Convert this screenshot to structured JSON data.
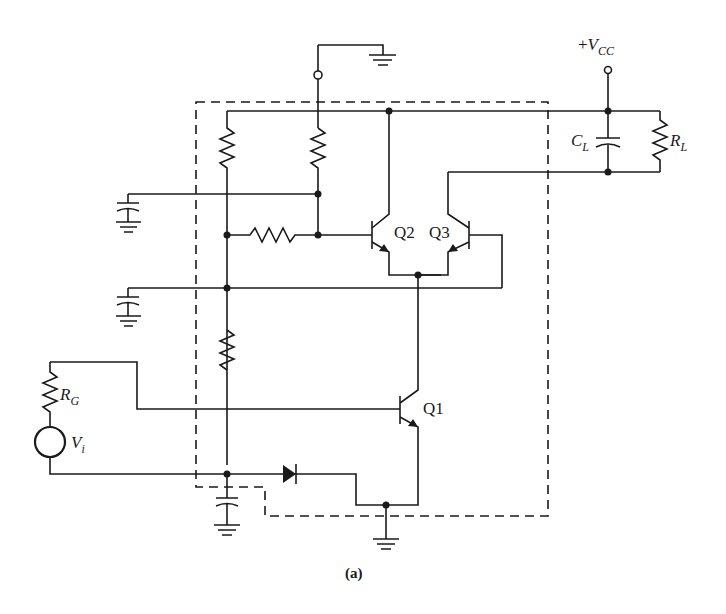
{
  "figure": {
    "caption": "(a)"
  },
  "labels": {
    "vcc_plus": "+",
    "vcc_main": "V",
    "vcc_sub": "CC",
    "cl_main": "C",
    "cl_sub": "L",
    "rl_main": "R",
    "rl_sub": "L",
    "rg_main": "R",
    "rg_sub": "G",
    "vi_main": "V",
    "vi_sub": "i",
    "q1": "Q1",
    "q2": "Q2",
    "q3": "Q3"
  },
  "components": [
    {
      "id": "Q1",
      "type": "npn-transistor"
    },
    {
      "id": "Q2",
      "type": "npn-transistor"
    },
    {
      "id": "Q3",
      "type": "npn-transistor"
    },
    {
      "id": "CL",
      "type": "capacitor",
      "label": "C_L"
    },
    {
      "id": "RL",
      "type": "resistor",
      "label": "R_L"
    },
    {
      "id": "RG",
      "type": "resistor",
      "label": "R_G"
    },
    {
      "id": "Vi",
      "type": "voltage-source",
      "label": "V_i"
    },
    {
      "id": "D1",
      "type": "diode"
    },
    {
      "id": "VCC",
      "type": "supply",
      "label": "+V_CC"
    }
  ]
}
